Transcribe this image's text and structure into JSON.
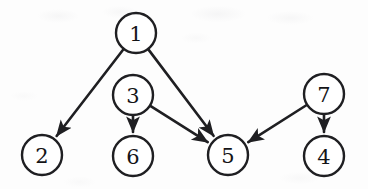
{
  "figure": {
    "kind": "directed-graph",
    "caption": "",
    "width": 368,
    "height": 189,
    "background_color": "#fdfdfd",
    "stroke_color": "#1f1f22",
    "node_fill_color": "#ffffff",
    "node_radius": 20
  },
  "nodes": [
    {
      "id": "1",
      "label": "1",
      "cx": 136,
      "cy": 33
    },
    {
      "id": "2",
      "label": "2",
      "cx": 42,
      "cy": 155
    },
    {
      "id": "3",
      "label": "3",
      "cx": 133,
      "cy": 95
    },
    {
      "id": "4",
      "label": "4",
      "cx": 324,
      "cy": 156
    },
    {
      "id": "5",
      "label": "5",
      "cx": 228,
      "cy": 155
    },
    {
      "id": "6",
      "label": "6",
      "cx": 133,
      "cy": 156
    },
    {
      "id": "7",
      "label": "7",
      "cx": 324,
      "cy": 94
    }
  ],
  "edges": [
    {
      "id": "e-1-2",
      "from": "1",
      "to": "2",
      "directed": true,
      "label": "1 to 2"
    },
    {
      "id": "e-1-5",
      "from": "1",
      "to": "5",
      "directed": true,
      "label": "1 to 5"
    },
    {
      "id": "e-3-6",
      "from": "3",
      "to": "6",
      "directed": true,
      "label": "3 to 6"
    },
    {
      "id": "e-3-5",
      "from": "3",
      "to": "5",
      "directed": true,
      "label": "3 to 5"
    },
    {
      "id": "e-7-5",
      "from": "7",
      "to": "5",
      "directed": true,
      "label": "7 to 5"
    },
    {
      "id": "e-7-4",
      "from": "7",
      "to": "4",
      "directed": true,
      "label": "7 to 4"
    }
  ]
}
